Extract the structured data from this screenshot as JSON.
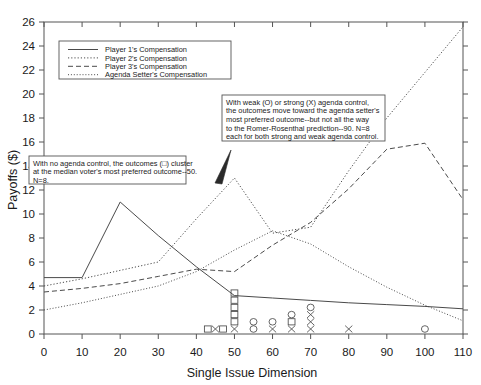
{
  "chart_data": {
    "type": "line",
    "title": "",
    "xlabel": "Single Issue Dimension",
    "ylabel": "Payoffs ($)",
    "xlim": [
      0,
      110
    ],
    "ylim": [
      0,
      26
    ],
    "xticks": [
      0,
      10,
      20,
      30,
      40,
      50,
      60,
      70,
      80,
      90,
      100,
      110
    ],
    "yticks": [
      0,
      2,
      4,
      6,
      8,
      10,
      12,
      14,
      16,
      18,
      20,
      22,
      24,
      26
    ],
    "grid": false,
    "legend_position": "upper-left",
    "x": [
      0,
      10,
      20,
      30,
      40,
      50,
      60,
      70,
      80,
      90,
      100,
      110
    ],
    "series": [
      {
        "name": "Player 1's Compensation",
        "dash": "solid",
        "values": [
          4.7,
          4.7,
          11.0,
          8.2,
          5.6,
          3.2,
          3.0,
          2.8,
          2.6,
          2.45,
          2.3,
          2.1
        ]
      },
      {
        "name": "Player 2's Compensation",
        "dash": "dotted",
        "values": [
          4.0,
          4.6,
          5.3,
          6.0,
          9.6,
          13.0,
          8.4,
          8.9,
          13.6,
          18.0,
          21.8,
          25.6
        ]
      },
      {
        "name": "Player 3's Compensation",
        "dash": "dashed",
        "values": [
          3.5,
          3.8,
          4.2,
          4.8,
          5.4,
          5.2,
          7.4,
          9.3,
          12.1,
          15.4,
          15.9,
          11.2
        ]
      },
      {
        "name": "Agenda Setter's Compensation",
        "dash": "fine-dotted",
        "values": [
          2.0,
          2.6,
          3.3,
          4.0,
          5.2,
          7.0,
          8.6,
          7.5,
          5.6,
          3.9,
          2.4,
          1.1
        ]
      }
    ],
    "scatter": {
      "square_label": "no agenda control outcome",
      "circle_label": "weak agenda control outcome",
      "cross_label": "strong agenda control outcome",
      "points": [
        {
          "x": 43,
          "marker": "square",
          "count": 1
        },
        {
          "x": 45,
          "marker": "cross",
          "count": 1
        },
        {
          "x": 47,
          "marker": "square",
          "count": 1
        },
        {
          "x": 50,
          "marker": "cross",
          "count": 1
        },
        {
          "x": 50,
          "marker": "square",
          "count": 5
        },
        {
          "x": 55,
          "marker": "circle",
          "count": 2
        },
        {
          "x": 60,
          "marker": "cross",
          "count": 1
        },
        {
          "x": 60,
          "marker": "circle",
          "count": 1
        },
        {
          "x": 65,
          "marker": "cross",
          "count": 1
        },
        {
          "x": 65,
          "marker": "square",
          "count": 1
        },
        {
          "x": 65,
          "marker": "circle",
          "count": 1
        },
        {
          "x": 70,
          "marker": "cross",
          "count": 3
        },
        {
          "x": 70,
          "marker": "circle",
          "count": 1
        },
        {
          "x": 80,
          "marker": "cross",
          "count": 1
        },
        {
          "x": 100,
          "marker": "circle",
          "count": 1
        }
      ]
    }
  },
  "legend": {
    "items": [
      {
        "label": "Player 1's Compensation",
        "dash": "solid"
      },
      {
        "label": "Player 2's Compensation",
        "dash": "dotted"
      },
      {
        "label": "Player 3's Compensation",
        "dash": "dashed"
      },
      {
        "label": "Agenda Setter's Compensation",
        "dash": "fine-dotted"
      }
    ]
  },
  "annotations": {
    "left_box": {
      "lines": [
        "With no agenda control, the outcomes (□) cluster",
        " at the median voter's most preferred outcome--50.",
        "N=8."
      ]
    },
    "right_box": {
      "lines": [
        "With weak (O) or strong (X) agenda control,",
        "the outcomes move toward the agenda setter's",
        "most preferred outcome--but not all the way",
        "to the Romer-Rosenthal prediction--90. N=8",
        "each for both strong and weak agenda control."
      ]
    }
  },
  "style": {
    "line_color": "#4a4a4a",
    "axis_color": "#555555",
    "text_color": "#1a1a1a",
    "background": "#ffffff"
  }
}
